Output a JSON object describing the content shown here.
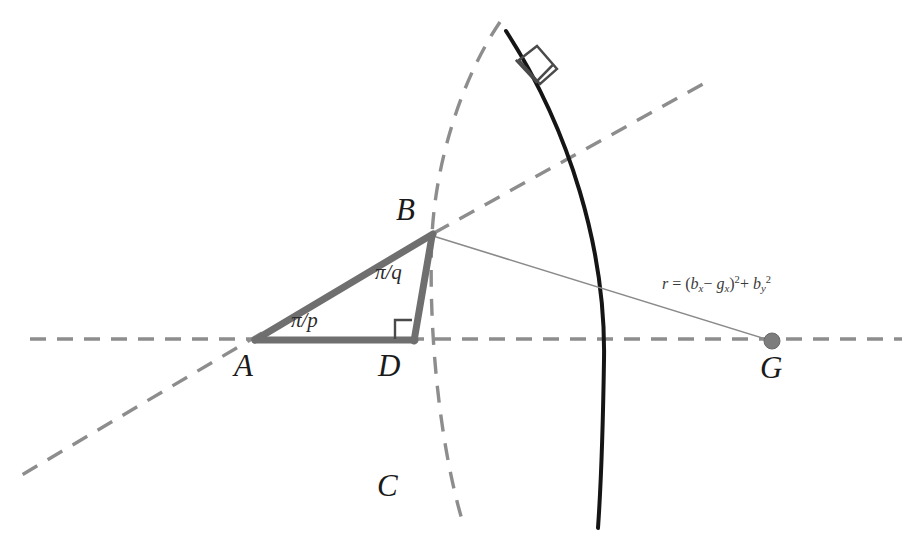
{
  "canvas": {
    "width": 922,
    "height": 550,
    "background": "#ffffff"
  },
  "colors": {
    "solid_arc": "#151515",
    "dashed_gray": "#8d8d8d",
    "triangle_gray": "#6f6f6f",
    "thin_line": "#8a8a8a",
    "label_black": "#1a1a1a",
    "point_dot": "#777777"
  },
  "labels": {
    "vertex_a": "A",
    "vertex_b": "B",
    "vertex_c": "C",
    "vertex_d": "D",
    "vertex_g": "G",
    "angle_p": "π/p",
    "angle_q": "π/q",
    "formula_r": "r",
    "formula_equals": "=",
    "formula_open_paren": "(",
    "formula_b": "b",
    "formula_b_sub": "x",
    "formula_minus": "−",
    "formula_g": "g",
    "formula_g_sub": "x",
    "formula_close_paren": ")",
    "formula_sq1": "2",
    "formula_plus": "+",
    "formula_b2": "b",
    "formula_b2_sub": "y",
    "formula_sq2": "2",
    "formula_full": "r = (b_x − g_x)² + b_y²"
  },
  "geometry": {
    "point_a": {
      "x": 255,
      "y": 340
    },
    "point_b": {
      "x": 432,
      "y": 235
    },
    "point_d": {
      "x": 413,
      "y": 340
    },
    "point_g": {
      "x": 772,
      "y": 341
    },
    "baseline_y": 339,
    "baseline_x_start": 30,
    "baseline_x_end": 902,
    "solid_arc_start": {
      "x": 506,
      "y": 31
    },
    "solid_arc_end": {
      "x": 598,
      "y": 528
    },
    "dashed_curve_c_top": {
      "x": 500,
      "y": 22
    },
    "dashed_curve_c_bottom": {
      "x": 463,
      "y": 523
    },
    "dashed_ray_from_b_end": {
      "x": 703,
      "y": 84
    },
    "dashed_ray_from_a_end": {
      "x": 20,
      "y": 475
    },
    "right_angle_d_size": 17,
    "right_angle_arc_center": {
      "x": 533,
      "y": 72
    }
  },
  "shapes": {
    "triangle_sides": [
      "A-B hypotenuse",
      "A-D base",
      "D-B vertical leg"
    ],
    "right_angle_markers": 2,
    "point_markers": 1
  }
}
